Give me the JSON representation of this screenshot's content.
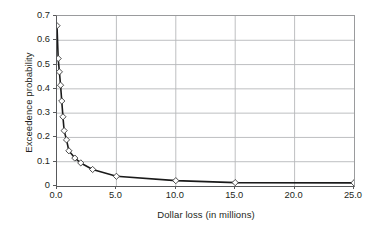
{
  "chart_data": {
    "type": "line",
    "title": "",
    "xlabel": "Dollar loss (in millions)",
    "ylabel": "Exceedence probability",
    "xlim": [
      0,
      25
    ],
    "ylim": [
      0,
      0.7
    ],
    "grid": true,
    "legend": null,
    "marker": "open-diamond",
    "line_color": "#1a1a1a",
    "grid_color": "#b7b8ba",
    "axis_color": "#58595b",
    "xticks": [
      "0.0",
      "5.0",
      "10.0",
      "15.0",
      "20.0",
      "25.0"
    ],
    "xtick_values": [
      0,
      5,
      10,
      15,
      20,
      25
    ],
    "yticks": [
      "0",
      "0.1",
      "0.2",
      "0.3",
      "0.4",
      "0.5",
      "0.6",
      "0.7"
    ],
    "ytick_values": [
      0,
      0.1,
      0.2,
      0.3,
      0.4,
      0.5,
      0.6,
      0.7
    ],
    "x": [
      0.0,
      0.1,
      0.2,
      0.3,
      0.4,
      0.5,
      0.6,
      0.8,
      1.0,
      1.5,
      2.0,
      3.0,
      5.0,
      10.0,
      15.0,
      25.0
    ],
    "y": [
      0.66,
      0.525,
      0.47,
      0.415,
      0.35,
      0.285,
      0.228,
      0.19,
      0.145,
      0.115,
      0.095,
      0.068,
      0.04,
      0.022,
      0.014,
      0.013
    ],
    "series": [
      {
        "name": "Exceedence probability",
        "values": [
          0.66,
          0.525,
          0.47,
          0.415,
          0.35,
          0.285,
          0.228,
          0.19,
          0.145,
          0.115,
          0.095,
          0.068,
          0.04,
          0.022,
          0.014,
          0.013
        ]
      }
    ]
  }
}
